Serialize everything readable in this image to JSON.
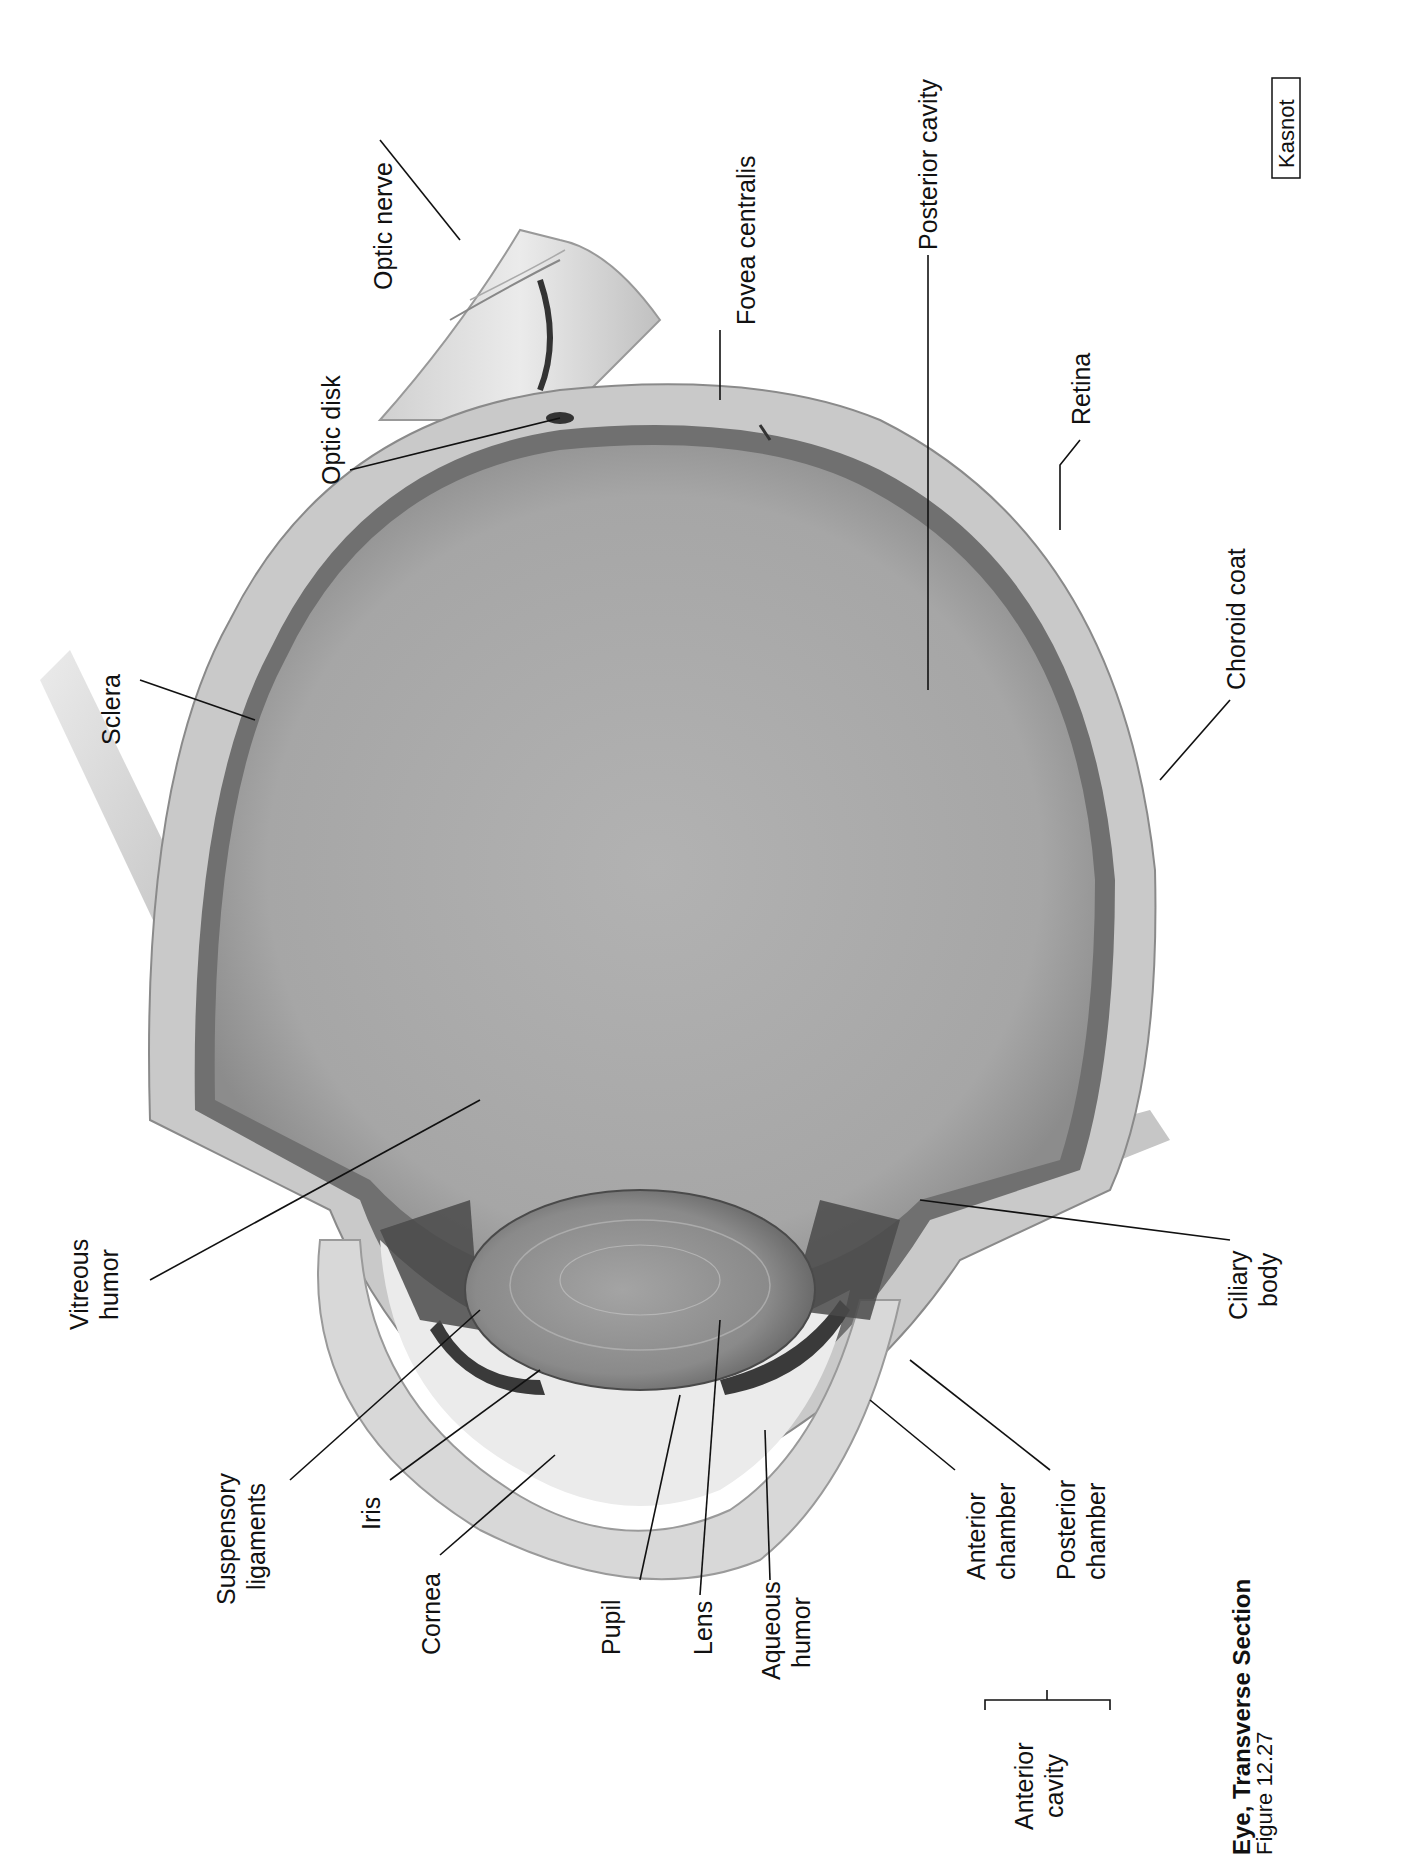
{
  "figure": {
    "title": "Eye, Transverse Section",
    "subtitle": "Figure 12.27",
    "credit": "Kasnot",
    "orientation": "rotated -90deg (landscape figure on portrait page)"
  },
  "labels": {
    "optic_nerve": "Optic nerve",
    "fovea_centralis": "Fovea centralis",
    "posterior_cavity": "Posterior cavity",
    "retina": "Retina",
    "choroid_coat": "Choroid coat",
    "optic_disk": "Optic disk",
    "sclera": "Sclera",
    "vitreous_humor_1": "Vitreous",
    "vitreous_humor_2": "humor",
    "ciliary_body_1": "Ciliary",
    "ciliary_body_2": "body",
    "suspensory_ligaments_1": "Suspensory",
    "suspensory_ligaments_2": "ligaments",
    "iris": "Iris",
    "cornea": "Cornea",
    "pupil": "Pupil",
    "lens": "Lens",
    "aqueous_humor_1": "Aqueous",
    "aqueous_humor_2": "humor",
    "anterior_chamber_1": "Anterior",
    "anterior_chamber_2": "chamber",
    "posterior_chamber_1": "Posterior",
    "posterior_chamber_2": "chamber",
    "anterior_cavity_1": "Anterior",
    "anterior_cavity_2": "cavity"
  },
  "colors": {
    "background": "#ffffff",
    "vitreous": "#a9a9a9",
    "sclera": "#c8c8c8",
    "choroid": "#6f6f6f",
    "lens": "#8e8e8e",
    "cornea": "#d9d9d9",
    "aqueous": "#e9e9e9",
    "muscle": "#bdbdbd",
    "text": "#111111"
  }
}
